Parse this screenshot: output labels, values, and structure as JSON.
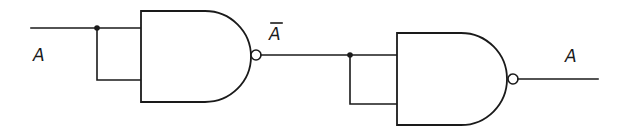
{
  "diagram": {
    "type": "logic-circuit",
    "labels": {
      "input": "A",
      "intermediate": "A",
      "intermediate_overbar": true,
      "output": "A"
    },
    "gates": [
      {
        "id": "nand-1",
        "kind": "NAND",
        "inputs_tied": true,
        "input": "A",
        "output": "Ā"
      },
      {
        "id": "nand-2",
        "kind": "NAND",
        "inputs_tied": true,
        "input": "Ā",
        "output": "A"
      }
    ],
    "colors": {
      "stroke": "#1a1a1a",
      "background": "#ffffff"
    }
  }
}
